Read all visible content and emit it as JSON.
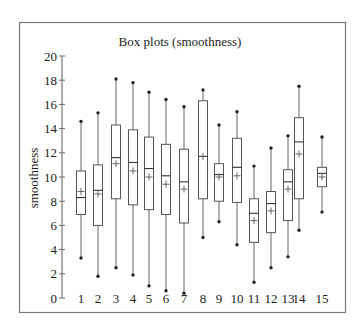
{
  "chart_data": {
    "type": "box",
    "title": "Box plots (smoothness)",
    "xlabel": "",
    "ylabel": "smoothness",
    "ylim": [
      0,
      20
    ],
    "yticks": [
      0,
      2,
      4,
      6,
      8,
      10,
      12,
      14,
      16,
      18,
      20
    ],
    "grid": false,
    "legend": null,
    "categories": [
      "1",
      "2",
      "3",
      "4",
      "5",
      "6",
      "7",
      "8",
      "9",
      "10",
      "11",
      "12",
      "13",
      "14",
      "15"
    ],
    "series": [
      {
        "name": "1",
        "min": 3.3,
        "q1": 6.9,
        "median": 8.3,
        "mean": 8.8,
        "q3": 10.5,
        "max": 14.6
      },
      {
        "name": "2",
        "min": 1.8,
        "q1": 6.0,
        "median": 8.9,
        "mean": 8.6,
        "q3": 11.0,
        "max": 15.3
      },
      {
        "name": "3",
        "min": 2.5,
        "q1": 8.2,
        "median": 11.6,
        "mean": 11.1,
        "q3": 14.3,
        "max": 18.1
      },
      {
        "name": "4",
        "min": 1.9,
        "q1": 7.7,
        "median": 11.2,
        "mean": 10.5,
        "q3": 13.9,
        "max": 17.8
      },
      {
        "name": "5",
        "min": 1.0,
        "q1": 7.3,
        "median": 10.7,
        "mean": 10.0,
        "q3": 13.3,
        "max": 17.0
      },
      {
        "name": "6",
        "min": 0.6,
        "q1": 6.9,
        "median": 10.1,
        "mean": 9.4,
        "q3": 12.7,
        "max": 16.4
      },
      {
        "name": "7",
        "min": 0.4,
        "q1": 6.2,
        "median": 9.6,
        "mean": 9.0,
        "q3": 12.3,
        "max": 15.8
      },
      {
        "name": "8",
        "min": 5.0,
        "q1": 8.2,
        "median": 11.7,
        "mean": 11.7,
        "q3": 16.3,
        "max": 17.2
      },
      {
        "name": "9",
        "min": 6.3,
        "q1": 8.0,
        "median": 10.2,
        "mean": 10.0,
        "q3": 11.1,
        "max": 14.3
      },
      {
        "name": "10",
        "min": 4.4,
        "q1": 7.9,
        "median": 10.8,
        "mean": 10.1,
        "q3": 13.2,
        "max": 15.4
      },
      {
        "name": "11",
        "min": 1.3,
        "q1": 4.6,
        "median": 7.0,
        "mean": 6.4,
        "q3": 8.2,
        "max": 10.9
      },
      {
        "name": "12",
        "min": 2.5,
        "q1": 5.4,
        "median": 7.8,
        "mean": 7.2,
        "q3": 8.8,
        "max": 12.4
      },
      {
        "name": "13",
        "min": 3.4,
        "q1": 6.4,
        "median": 9.6,
        "mean": 9.0,
        "q3": 10.6,
        "max": 13.4
      },
      {
        "name": "14",
        "min": 5.6,
        "q1": 8.2,
        "median": 12.9,
        "mean": 11.9,
        "q3": 14.9,
        "max": 17.5
      },
      {
        "name": "15",
        "min": 7.1,
        "q1": 9.2,
        "median": 10.3,
        "mean": 10.0,
        "q3": 10.8,
        "max": 13.3
      }
    ]
  },
  "layout": {
    "x_positions": [
      81,
      98,
      116,
      133,
      149,
      166,
      184,
      203,
      219,
      237,
      254,
      271,
      288,
      299,
      322
    ],
    "y_zero_px": 298,
    "px_per_unit": 12.1
  }
}
